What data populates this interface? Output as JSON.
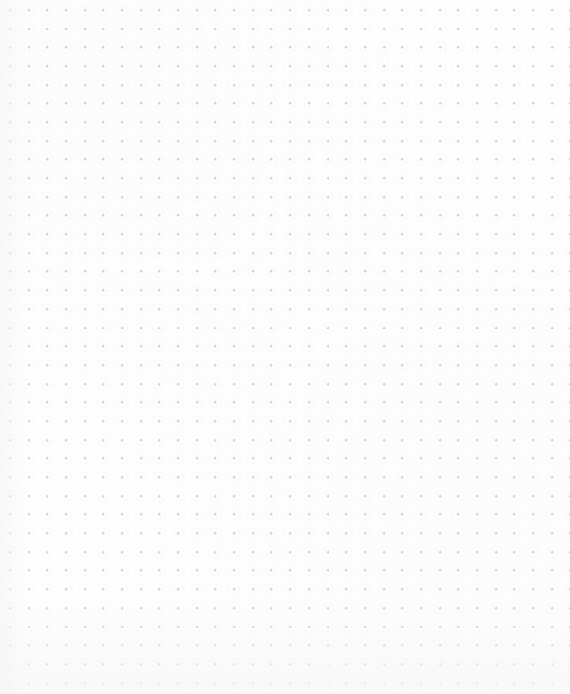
{
  "page": {
    "kind": "dot-grid-canvas",
    "width_px": 570,
    "height_px": 694,
    "background_color": "#ffffff",
    "paper_color": "#fefefe",
    "has_text": false,
    "has_chrome": false,
    "has_toolbar": false,
    "has_cursor": false
  },
  "grid": {
    "mark_shape": "plus-cross",
    "mark_color": "#c9c9ce",
    "halo_color": "#ededf1",
    "spacing_x_px": 18.7,
    "spacing_y_px": 18.7,
    "origin_x_px": 10,
    "origin_y_px": 10,
    "mark_size_px": 3,
    "mark_stroke_px": 1,
    "columns": 30,
    "rows": 37,
    "opacity": 0.95
  },
  "edges": {
    "left_tint_color": "#f6f6f8",
    "bottom_tint_color": "#f7f7f8",
    "left_tint_width_px": 26,
    "bottom_tint_height_px": 96,
    "bottom_margin_px": 11,
    "right_margin_px": 13,
    "top_margin_px": 10
  }
}
